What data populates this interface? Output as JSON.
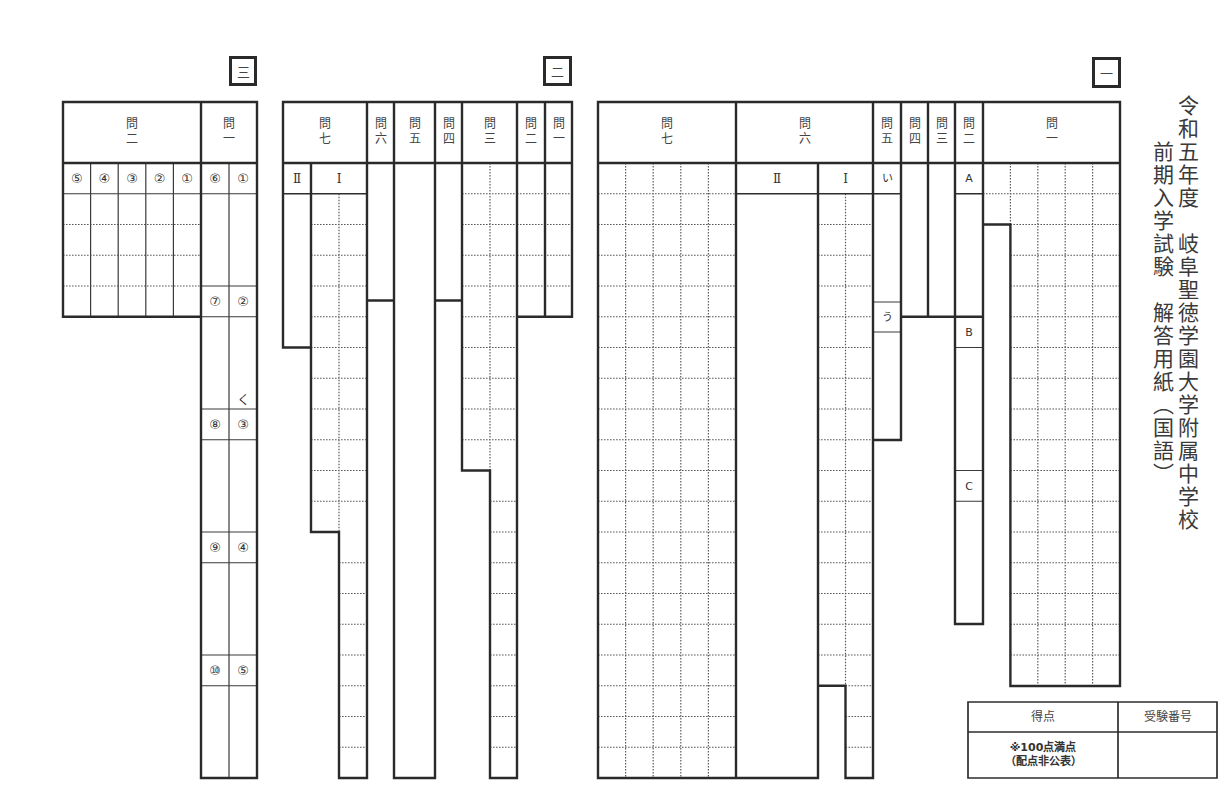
{
  "title": {
    "line1": "令和五年度　岐阜聖徳学園大学附属中学校",
    "line2": "前期入学試験　解答用紙（国語）"
  },
  "sections": [
    {
      "number": "一",
      "questions": [
        {
          "label": "問",
          "num": "一"
        },
        {
          "label": "問",
          "num": "二",
          "parts": [
            "A",
            "B",
            "C"
          ]
        },
        {
          "label": "問",
          "num": "三"
        },
        {
          "label": "問",
          "num": "四"
        },
        {
          "label": "問",
          "num": "五",
          "parts": [
            "い",
            "う"
          ]
        },
        {
          "label": "問",
          "num": "六",
          "parts": [
            "Ⅰ",
            "Ⅱ"
          ]
        },
        {
          "label": "問",
          "num": "七"
        }
      ]
    },
    {
      "number": "二",
      "questions": [
        {
          "label": "問",
          "num": "一"
        },
        {
          "label": "問",
          "num": "二"
        },
        {
          "label": "問",
          "num": "三"
        },
        {
          "label": "問",
          "num": "四"
        },
        {
          "label": "問",
          "num": "五"
        },
        {
          "label": "問",
          "num": "六"
        },
        {
          "label": "問",
          "num": "七",
          "parts": [
            "Ⅰ",
            "Ⅱ"
          ]
        }
      ]
    },
    {
      "number": "三",
      "questions": [
        {
          "label": "問",
          "num": "一",
          "parts": [
            "①",
            "②",
            "③",
            "④",
            "⑤",
            "⑥",
            "⑦",
            "⑧",
            "⑨",
            "⑩"
          ],
          "hint": "く"
        },
        {
          "label": "問",
          "num": "二",
          "parts": [
            "①",
            "②",
            "③",
            "④",
            "⑤"
          ]
        }
      ]
    }
  ],
  "score_box": {
    "score_label": "得点",
    "score_note_1": "※100点満点",
    "score_note_2": "（配点非公表）",
    "exam_number_label": "受験番号"
  }
}
